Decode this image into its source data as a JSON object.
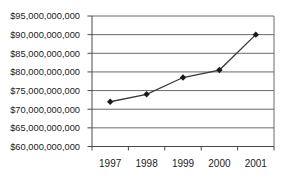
{
  "figure": {
    "background": "#ffffff"
  },
  "chart_data": {
    "type": "line",
    "title": "",
    "xlabel": "",
    "ylabel": "",
    "legend": "none",
    "grid": "horizontal",
    "categories": [
      "1997",
      "1998",
      "1999",
      "2000",
      "2001"
    ],
    "series": [
      {
        "name": "series-1",
        "marker": "diamond",
        "values": [
          72000000000,
          74000000000,
          78500000000,
          80500000000,
          90000000000
        ]
      }
    ],
    "ylim": [
      60000000000,
      95000000000
    ],
    "ytick_interval": 5000000000,
    "yticks": [
      {
        "value": 95000000000,
        "label": "$95,000,000,000"
      },
      {
        "value": 90000000000,
        "label": "$90,000,000,000"
      },
      {
        "value": 85000000000,
        "label": "$85,000,000,000"
      },
      {
        "value": 80000000000,
        "label": "$80,000,000,000"
      },
      {
        "value": 75000000000,
        "label": "$75,000,000,000"
      },
      {
        "value": 70000000000,
        "label": "$70,000,000,000"
      },
      {
        "value": 65000000000,
        "label": "$65,000,000,000"
      },
      {
        "value": 60000000000,
        "label": "$60,000,000,000"
      }
    ],
    "colors": {
      "line": "#3a3a3a",
      "marker": "#1a1a1a",
      "grid": "#6b6b6b",
      "axis": "#4a4a4a",
      "text": "#1c1c1c",
      "background": "#ffffff"
    }
  }
}
